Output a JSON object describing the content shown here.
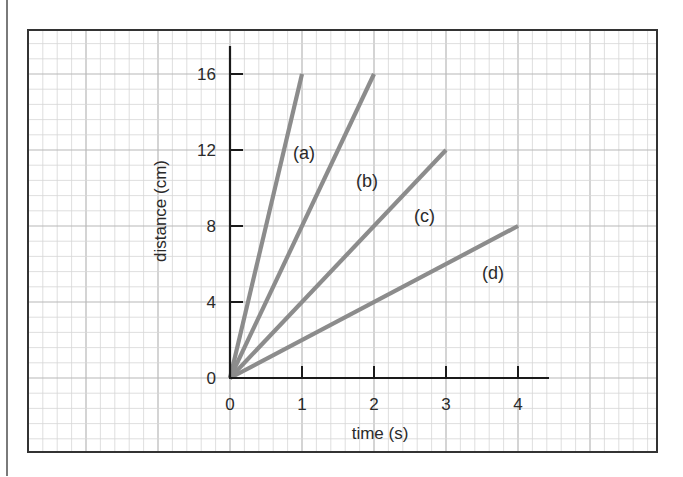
{
  "chart_data": {
    "type": "line",
    "title": "",
    "xlabel": "time (s)",
    "ylabel": "distance (cm)",
    "xlim": [
      0,
      4
    ],
    "ylim": [
      0,
      16
    ],
    "x_ticks": [
      "0",
      "1",
      "2",
      "3",
      "4"
    ],
    "y_ticks": [
      "0",
      "4",
      "8",
      "12",
      "16"
    ],
    "grid": true,
    "legend": "none (inline labels)",
    "series": [
      {
        "name": "(a)",
        "x": [
          0,
          1
        ],
        "y": [
          0,
          16
        ],
        "speed_cm_per_s": 16
      },
      {
        "name": "(b)",
        "x": [
          0,
          2
        ],
        "y": [
          0,
          16
        ],
        "speed_cm_per_s": 8
      },
      {
        "name": "(c)",
        "x": [
          0,
          3
        ],
        "y": [
          0,
          12
        ],
        "speed_cm_per_s": 4
      },
      {
        "name": "(d)",
        "x": [
          0,
          4
        ],
        "y": [
          0,
          8
        ],
        "speed_cm_per_s": 2
      }
    ]
  },
  "labels": {
    "xlabel": "time (s)",
    "ylabel": "distance (cm)",
    "x_ticks": [
      "0",
      "1",
      "2",
      "3",
      "4"
    ],
    "y_ticks": [
      "0",
      "4",
      "8",
      "12",
      "16"
    ],
    "series": [
      "(a)",
      "(b)",
      "(c)",
      "(d)"
    ]
  },
  "colors": {
    "line": "#8c8c8c",
    "axis": "#1a1a1a",
    "grid_minor": "#d6d6d6",
    "grid_major": "#b8b8b8",
    "border": "#333333"
  }
}
